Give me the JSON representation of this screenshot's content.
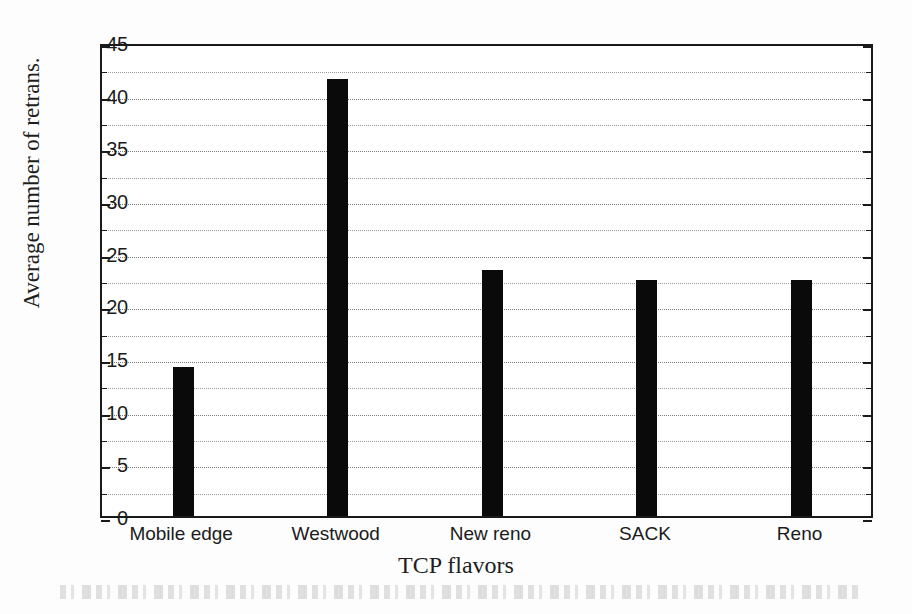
{
  "chart_data": {
    "type": "bar",
    "title": "",
    "xlabel": "TCP flavors",
    "ylabel": "Average number of retrans.",
    "categories": [
      "Mobile edge",
      "Westwood",
      "New reno",
      "SACK",
      "Reno"
    ],
    "values": [
      14.1,
      41.5,
      23.4,
      22.4,
      22.4
    ],
    "ylim": [
      0,
      45
    ],
    "ytick_labels": [
      "0",
      "5",
      "10",
      "15",
      "20",
      "25",
      "30",
      "35",
      "40",
      "45"
    ],
    "ytick_values": [
      0,
      5,
      10,
      15,
      20,
      25,
      30,
      35,
      40,
      45
    ],
    "minor_tick_step": 2.5,
    "grid": "horizontal-dotted",
    "legend": "none",
    "bar_color": "#0a0a0a",
    "axis_color": "#1a1a1a",
    "grid_color": "#8c8c8c",
    "background_color": "#ffffff"
  },
  "figure": {
    "page_background": "#fdfdfd",
    "scan_artifact_present": true
  }
}
